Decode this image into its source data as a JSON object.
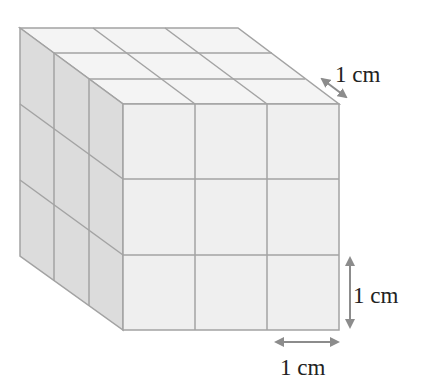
{
  "diagram": {
    "grid": {
      "cols": 3,
      "rows": 3,
      "depth": 3
    },
    "colors": {
      "front_face": "#efefef",
      "side_face": "#dcdcdc",
      "top_face": "#f4f4f4",
      "edge": "#a3a3a3",
      "arrow": "#8c8c8c",
      "text": "#222222"
    },
    "labels": {
      "depth": "1 cm",
      "height": "1 cm",
      "width": "1 cm"
    }
  }
}
